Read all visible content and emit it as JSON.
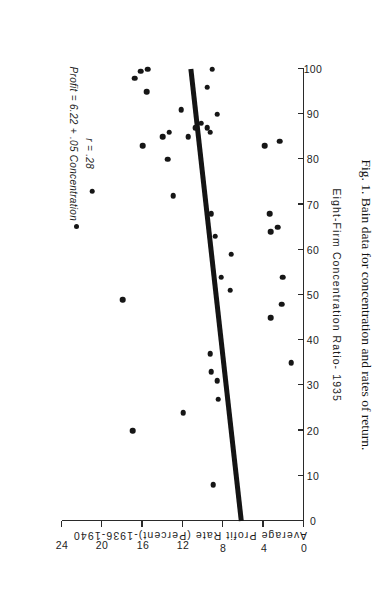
{
  "figure": {
    "caption": "Fig. 1. Bain data for concentration and rates of return.",
    "annotation_equation": "Profit = 6.22 + .05 Concentration",
    "annotation_r": "r = .28",
    "annotation_marker": "filled-circle"
  },
  "chart_data": {
    "type": "scatter",
    "title": "",
    "xlabel": "Eight-Firm Concentration Ratio- 1935",
    "ylabel": "Average Profit Rate (Percent)-1936-1940",
    "xlim": [
      0,
      100
    ],
    "ylim": [
      0,
      24
    ],
    "xticks": [
      0,
      10,
      20,
      30,
      40,
      50,
      60,
      70,
      80,
      90,
      100
    ],
    "xticklabels": [
      "0",
      "10",
      "20",
      "30",
      "40",
      "50",
      "60",
      "70",
      "80",
      "90",
      "100"
    ],
    "yticks": [
      0,
      4,
      8,
      12,
      16,
      20,
      24
    ],
    "yticklabels": [
      "0",
      "4",
      "8",
      "12",
      "16",
      "20",
      "24"
    ],
    "grid": false,
    "legend": null,
    "orientation_note": "image is rotated 90 degrees",
    "annotations": [
      {
        "text": "Profit = 6.22 + .05 Concentration",
        "x": 8,
        "y": 23
      },
      {
        "text": "r = .28",
        "x": 16,
        "y": 21.4
      }
    ],
    "fit_line": {
      "label": "least-squares regression",
      "intercept": 6.22,
      "slope": 0.05,
      "x_start": 0,
      "x_end": 100,
      "y_start": 6.22,
      "y_end": 11.22
    },
    "points": [
      {
        "x": 8,
        "y": 9
      },
      {
        "x": 20,
        "y": 17
      },
      {
        "x": 24,
        "y": 12
      },
      {
        "x": 27,
        "y": 8.5
      },
      {
        "x": 31,
        "y": 8.6
      },
      {
        "x": 33,
        "y": 9.2
      },
      {
        "x": 35,
        "y": 1.3
      },
      {
        "x": 37,
        "y": 9.3
      },
      {
        "x": 45,
        "y": 3.3
      },
      {
        "x": 48,
        "y": 2.2
      },
      {
        "x": 49,
        "y": 18
      },
      {
        "x": 51,
        "y": 7.3
      },
      {
        "x": 54,
        "y": 8.2
      },
      {
        "x": 54,
        "y": 2.1
      },
      {
        "x": 59,
        "y": 7.2
      },
      {
        "x": 63,
        "y": 8.8
      },
      {
        "x": 64,
        "y": 3.3
      },
      {
        "x": 65,
        "y": 2.6
      },
      {
        "x": 68,
        "y": 9.2
      },
      {
        "x": 68,
        "y": 3.4
      },
      {
        "x": 72,
        "y": 13
      },
      {
        "x": 73,
        "y": 21
      },
      {
        "x": 80,
        "y": 13.5
      },
      {
        "x": 83,
        "y": 16
      },
      {
        "x": 83,
        "y": 3.9
      },
      {
        "x": 84,
        "y": 2.4
      },
      {
        "x": 85,
        "y": 14
      },
      {
        "x": 85,
        "y": 11.5
      },
      {
        "x": 86,
        "y": 9.3
      },
      {
        "x": 86,
        "y": 13.4
      },
      {
        "x": 87,
        "y": 10.8
      },
      {
        "x": 87,
        "y": 9.6
      },
      {
        "x": 88,
        "y": 10.2
      },
      {
        "x": 90,
        "y": 8.6
      },
      {
        "x": 91,
        "y": 12.2
      },
      {
        "x": 95,
        "y": 15.6
      },
      {
        "x": 96,
        "y": 9.6
      },
      {
        "x": 98,
        "y": 16.8
      },
      {
        "x": 99.5,
        "y": 16.2
      },
      {
        "x": 100,
        "y": 15.5
      },
      {
        "x": 100,
        "y": 9.1
      }
    ]
  }
}
